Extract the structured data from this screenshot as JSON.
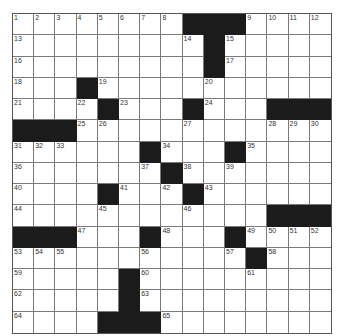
{
  "puzzle": {
    "rows": 15,
    "cols": 15,
    "colors": {
      "block": "#1b1b1b",
      "line": "#7a7a7a",
      "background": "#ffffff",
      "number": "#333333"
    },
    "grid": [
      [
        "1",
        "2",
        "3",
        "4",
        "5",
        "6",
        "7",
        "8",
        "#",
        "#",
        "#",
        "9",
        "10",
        "11",
        "12"
      ],
      [
        "13",
        "",
        "",
        "",
        "",
        "",
        "",
        "",
        "14",
        "#",
        "15",
        "",
        "",
        "",
        ""
      ],
      [
        "16",
        "",
        "",
        "",
        "",
        "",
        "",
        "",
        "",
        "#",
        "17",
        "",
        "",
        "",
        ""
      ],
      [
        "18",
        "",
        "",
        "#",
        "19",
        "",
        "",
        "",
        "",
        "20",
        "",
        "",
        "",
        "",
        ""
      ],
      [
        "21",
        "",
        "",
        "22",
        "#",
        "23",
        "",
        "",
        "#",
        "24",
        "",
        "",
        "#",
        "#",
        "#"
      ],
      [
        "#",
        "#",
        "#",
        "25",
        "26",
        "",
        "",
        "",
        "27",
        "",
        "",
        "",
        "28",
        "29",
        "30"
      ],
      [
        "31",
        "32",
        "33",
        "",
        "",
        "",
        "#",
        "34",
        "",
        "",
        "#",
        "35",
        "",
        "",
        ""
      ],
      [
        "36",
        "",
        "",
        "",
        "",
        "",
        "37",
        "#",
        "38",
        "",
        "39",
        "",
        "",
        "",
        ""
      ],
      [
        "40",
        "",
        "",
        "",
        "#",
        "41",
        "",
        "42",
        "#",
        "43",
        "",
        "",
        "",
        "",
        ""
      ],
      [
        "44",
        "",
        "",
        "",
        "45",
        "",
        "",
        "",
        "46",
        "",
        "",
        "",
        "#",
        "#",
        "#"
      ],
      [
        "#",
        "#",
        "#",
        "47",
        "",
        "",
        "#",
        "48",
        "",
        "",
        "#",
        "49",
        "50",
        "51",
        "52"
      ],
      [
        "53",
        "54",
        "55",
        "",
        "",
        "",
        "56",
        "",
        "",
        "",
        "57",
        "#",
        "58",
        "",
        ""
      ],
      [
        "59",
        "",
        "",
        "",
        "",
        "#",
        "60",
        "",
        "",
        "",
        "",
        "61",
        "",
        "",
        ""
      ],
      [
        "62",
        "",
        "",
        "",
        "",
        "#",
        "63",
        "",
        "",
        "",
        "",
        "",
        "",
        "",
        ""
      ],
      [
        "64",
        "",
        "",
        "",
        "#",
        "#",
        "#",
        "65",
        "",
        "",
        "",
        "",
        "",
        "",
        ""
      ]
    ]
  }
}
